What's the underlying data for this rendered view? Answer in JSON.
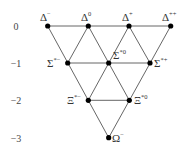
{
  "diagram": {
    "type": "baryon-decuplet",
    "axis_labels": [
      {
        "text": "0",
        "y": 26
      },
      {
        "text": "−1",
        "y": 63
      },
      {
        "text": "−2",
        "y": 100
      },
      {
        "text": "−3",
        "y": 138
      }
    ],
    "nodes": [
      {
        "id": "delta-minus",
        "base": "Δ",
        "sup": "−",
        "x": 47.7,
        "y": 26
      },
      {
        "id": "delta-zero",
        "base": "Δ",
        "sup": "0",
        "x": 88.3,
        "y": 26
      },
      {
        "id": "delta-plus",
        "base": "Δ",
        "sup": "+",
        "x": 129,
        "y": 26
      },
      {
        "id": "delta-plusplus",
        "base": "Δ",
        "sup": "++",
        "x": 170.7,
        "y": 26
      },
      {
        "id": "sigma-star-minus",
        "base": "Σ",
        "sup": "*−",
        "x": 67.7,
        "y": 63
      },
      {
        "id": "sigma-star-zero",
        "base": "Σ",
        "sup": "*0",
        "x": 108.7,
        "y": 63
      },
      {
        "id": "sigma-star-plus",
        "base": "Σ",
        "sup": "*+",
        "x": 150,
        "y": 63
      },
      {
        "id": "xi-star-minus",
        "base": "Ξ",
        "sup": "*−",
        "x": 88.3,
        "y": 100.3
      },
      {
        "id": "xi-star-zero",
        "base": "Ξ",
        "sup": "*0",
        "x": 129.3,
        "y": 100.3
      },
      {
        "id": "omega-minus",
        "base": "Ω",
        "sup": "−",
        "x": 108.7,
        "y": 137.7
      }
    ]
  }
}
